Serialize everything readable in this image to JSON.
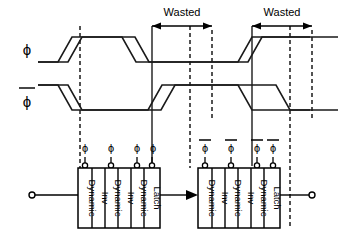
{
  "figure": {
    "type": "timing-diagram",
    "title": "",
    "background": "#ffffff",
    "stroke_color": "#000000"
  },
  "waveforms": {
    "rows": [
      {
        "name": "phi",
        "label": "ϕ",
        "overline": false,
        "baseline_y": 62,
        "top_y": 37,
        "description": "clock phase phi"
      },
      {
        "name": "phi-bar",
        "label": "ϕ",
        "overline": true,
        "baseline_y": 110,
        "top_y": 85,
        "description": "complementary clock phase phi-bar"
      }
    ]
  },
  "annotations": {
    "wasted": [
      {
        "label": "Wasted",
        "text_x": 182,
        "text_y": 14,
        "arrow_x1": 152,
        "arrow_x2": 212,
        "arrow_y": 26
      },
      {
        "label": "Wasted",
        "text_x": 282,
        "text_y": 14,
        "arrow_x1": 252,
        "arrow_x2": 312,
        "arrow_y": 26
      }
    ]
  },
  "markers": {
    "dashed_lines_x": [
      80,
      190,
      290
    ],
    "solid_lines_x": [
      152,
      252
    ]
  },
  "circuit": {
    "input_terminal": {
      "name": "input",
      "x": 32,
      "y": 195
    },
    "output_terminal": {
      "name": "output",
      "x": 312,
      "y": 195
    },
    "interstage_arrow": {
      "x1": 162,
      "x2": 188,
      "y": 195
    },
    "groups": [
      {
        "name": "stage-1",
        "x": 78,
        "y": 168,
        "width": 82,
        "height": 60,
        "clock_label": "ϕ",
        "clock_overline": false,
        "blocks": [
          {
            "label": "Dynamic",
            "clocked": true
          },
          {
            "label": "Inv",
            "clocked": false
          },
          {
            "label": "Dynamic",
            "clocked": true
          },
          {
            "label": "Inv",
            "clocked": false
          },
          {
            "label": "Dynamic",
            "clocked": true
          },
          {
            "label": "Latch",
            "clocked": true
          }
        ]
      },
      {
        "name": "stage-2",
        "x": 198,
        "y": 168,
        "width": 82,
        "height": 60,
        "clock_label": "ϕ",
        "clock_overline": true,
        "blocks": [
          {
            "label": "Dynamic",
            "clocked": true
          },
          {
            "label": "Inv",
            "clocked": false
          },
          {
            "label": "Dynamic",
            "clocked": true
          },
          {
            "label": "Inv",
            "clocked": false
          },
          {
            "label": "Dynamic",
            "clocked": true
          },
          {
            "label": "Latch",
            "clocked": true
          }
        ]
      }
    ]
  }
}
